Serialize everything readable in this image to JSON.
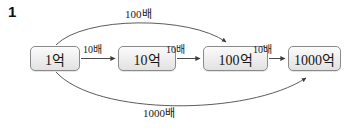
{
  "problem": {
    "number": "1"
  },
  "diagram": {
    "type": "flow-chain",
    "nodes": [
      {
        "id": "node-0",
        "label": "1억"
      },
      {
        "id": "node-1",
        "label": "10억"
      },
      {
        "id": "node-2",
        "label": "100억"
      },
      {
        "id": "node-3",
        "label": "1000억"
      }
    ],
    "step_arrows": [
      {
        "from": "1억",
        "to": "10억",
        "label": "10배"
      },
      {
        "from": "10억",
        "to": "100억",
        "label": "10배"
      },
      {
        "from": "100억",
        "to": "1000억",
        "label": "10배"
      }
    ],
    "arcs": [
      {
        "position": "top",
        "from": "1억",
        "to": "100억",
        "label": "100배"
      },
      {
        "position": "bottom",
        "from": "1억",
        "to": "1000억",
        "label": "1000배"
      }
    ],
    "colors": {
      "box_border": "#8a8a8a",
      "box_fill_top": "#fbfbfb",
      "box_fill_bottom": "#e2e2e2",
      "line": "#4a4a4a",
      "text": "#161616",
      "background": "#ffffff"
    }
  }
}
